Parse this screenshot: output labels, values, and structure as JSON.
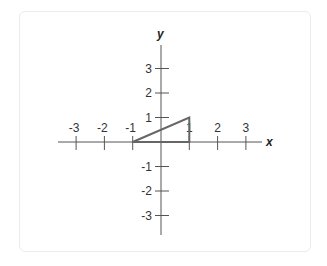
{
  "diagram": {
    "type": "coordinate-plane",
    "x_axis": {
      "label": "x",
      "range": [
        -3,
        3
      ],
      "ticks": [
        -3,
        -2,
        -1,
        1,
        2,
        3
      ],
      "tick_labels": [
        "-3",
        "-2",
        "-1",
        "1",
        "2",
        "3"
      ]
    },
    "y_axis": {
      "label": "y",
      "range": [
        -3,
        3
      ],
      "ticks": [
        -3,
        -2,
        -1,
        1,
        2,
        3
      ],
      "tick_labels": [
        "-3",
        "-2",
        "-1",
        "1",
        "2",
        "3"
      ]
    },
    "shapes": [
      {
        "name": "triangle",
        "vertices": [
          [
            -1,
            0
          ],
          [
            1,
            0
          ],
          [
            1,
            1
          ]
        ],
        "stroke": "#666666"
      }
    ],
    "colors": {
      "axis": "#555555",
      "shape": "#666666",
      "card_border": "#ececec"
    }
  }
}
